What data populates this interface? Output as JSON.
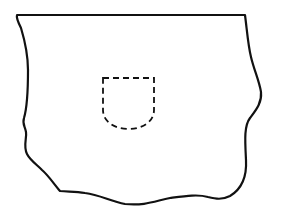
{
  "diagram": {
    "colors": {
      "background": "#ffffff",
      "stroke": "#111111"
    },
    "fragment": {
      "label": "",
      "stroke_width": 2.2,
      "path": "M17,15 L245,15 C247,30 248,45 251,57 C254,70 259,80 261,92 C262,103 256,110 250,118 C244,126 245,140 246,160 C247,178 240,190 230,196 C222,200 216,199 208,197 C198,194 185,196 170,198 C155,201 145,206 125,204 C110,201 100,195 85,193 C75,191 68,192 60,191 C54,184 48,175 42,170 C36,164 30,160 27,154 C23,146 27,138 26,132 C25,126 22,124 24,118 C27,108 28,95 28,70 C28,52 24,38 21,28 C18,22 16,18 17,15 Z"
    },
    "shield": {
      "label": "",
      "stroke_width": 1.8,
      "dash": "6,4",
      "path": "M103,78 L154,78 L154,110 C154,122 142,129 128.5,129 C115,129 103,122 103,110 Z"
    }
  }
}
